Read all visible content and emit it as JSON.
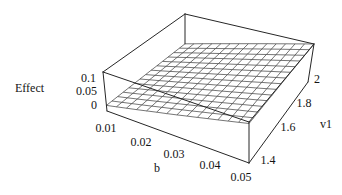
{
  "figure": {
    "background": "#ffffff",
    "edge_color": "#262626",
    "mesh_color": "#3a3a3a",
    "text_color": "#141414"
  },
  "chart_data": {
    "type": "surface3d",
    "title": "",
    "xlabel": "b",
    "ylabel": "v1",
    "zlabel": "Effect",
    "x_range": [
      0.01,
      0.05
    ],
    "y_range": [
      1.4,
      2
    ],
    "z_axis_range": [
      0,
      0.1
    ],
    "box_z_range": [
      -0.015,
      0.125
    ],
    "x_ticks": [
      0.01,
      0.02,
      0.03,
      0.04,
      0.05
    ],
    "y_ticks": [
      1.4,
      1.6,
      1.8,
      2
    ],
    "z_ticks": [
      0,
      0.05,
      0.1
    ],
    "grid_on": true,
    "mesh_divisions": 14,
    "x_values": [
      0.01,
      0.02,
      0.03,
      0.04,
      0.05
    ],
    "y_values": [
      1.4,
      1.55,
      1.7,
      1.85,
      2
    ],
    "z_grid": [
      [
        0.005,
        0.0083,
        0.0115,
        0.0148,
        0.018
      ],
      [
        0.0338,
        0.0365,
        0.0393,
        0.042,
        0.0448
      ],
      [
        0.0625,
        0.0648,
        0.067,
        0.0693,
        0.0715
      ],
      [
        0.0913,
        0.093,
        0.0948,
        0.0965,
        0.0983
      ],
      [
        0.12,
        0.1213,
        0.1225,
        0.1238,
        0.125
      ]
    ]
  }
}
